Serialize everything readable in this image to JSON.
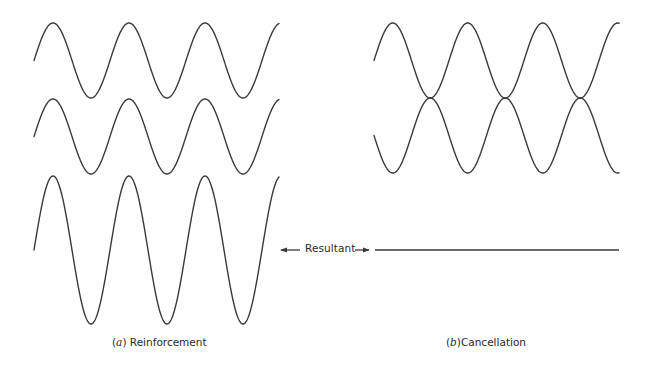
{
  "diagram": {
    "panel_a": {
      "caption_letter": "a",
      "caption_text": "Reinforcement",
      "waves": [
        {
          "name": "wave-1",
          "x_start": 34,
          "x_end": 279,
          "center_y": 60.5,
          "amplitude": 37.5,
          "period": 76,
          "phase": 0
        },
        {
          "name": "wave-2",
          "x_start": 34,
          "x_end": 279,
          "center_y": 136.5,
          "amplitude": 37.5,
          "period": 76,
          "phase": 0
        },
        {
          "name": "resultant-wave",
          "x_start": 34,
          "x_end": 279,
          "center_y": 250,
          "amplitude": 74,
          "period": 76,
          "phase": 0
        }
      ]
    },
    "panel_b": {
      "caption_letter": "b",
      "caption_text": "Cancellation",
      "waves": [
        {
          "name": "wave-1",
          "x_start": 374,
          "x_end": 619,
          "center_y": 60.5,
          "amplitude": 37.5,
          "period": 75,
          "phase": 0
        },
        {
          "name": "wave-2",
          "x_start": 374,
          "x_end": 619,
          "center_y": 135.5,
          "amplitude": 37.5,
          "period": 75,
          "phase": 3.14159
        }
      ],
      "resultant_line": {
        "x_start": 375,
        "x_end": 619,
        "y": 250
      }
    },
    "resultant_label": "Resultant",
    "stroke_color": "#3a3a3a",
    "background_color": "#ffffff"
  }
}
